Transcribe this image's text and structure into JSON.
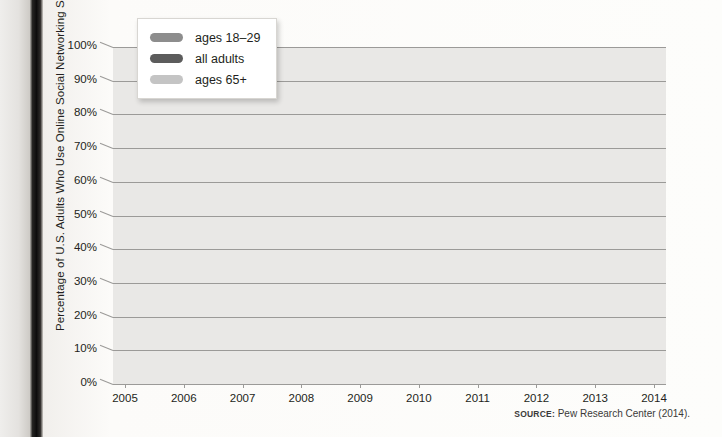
{
  "axis": {
    "y_title": "Percentage of U.S. Adults Who Use Online Social Networking Sites",
    "y_ticks": [
      "100%",
      "90%",
      "80%",
      "70%",
      "60%",
      "50%",
      "40%",
      "30%",
      "20%",
      "10%",
      "0%"
    ],
    "x_ticks": [
      "2005",
      "2006",
      "2007",
      "2008",
      "2009",
      "2010",
      "2011",
      "2012",
      "2013",
      "2014"
    ]
  },
  "legend": {
    "items": [
      {
        "label": "ages 18–29",
        "color": "#8d8d8d"
      },
      {
        "label": "all adults",
        "color": "#5c5c5c"
      },
      {
        "label": "ages 65+",
        "color": "#c4c4c4"
      }
    ]
  },
  "source": {
    "keyword": "SOURCE:",
    "text": " Pew Research Center (2014)."
  },
  "colors": {
    "plot_background": "#e9e8e6",
    "gridline": "#9b9a98",
    "text": "#231f20"
  },
  "chart_data": {
    "type": "line",
    "title": "",
    "xlabel": "",
    "ylabel": "Percentage of U.S. Adults Who Use Online Social Networking Sites",
    "x": [
      2005,
      2006,
      2007,
      2008,
      2009,
      2010,
      2011,
      2012,
      2013,
      2014
    ],
    "xlim": [
      2005,
      2014
    ],
    "ylim": [
      0,
      100
    ],
    "ytick_step": 10,
    "grid": true,
    "legend_position": "top-left",
    "series": [
      {
        "name": "ages 18–29",
        "color": "#8d8d8d",
        "values": [
          21.5,
          40,
          59,
          79,
          77,
          92,
          92,
          90,
          93,
          93
        ]
      },
      {
        "name": "all adults",
        "color": "#5c5c5c",
        "values": [
          16,
          23,
          30,
          37,
          51,
          66,
          69,
          71,
          76,
          78
        ]
      },
      {
        "name": "ages 65+",
        "color": "#c4c4c4",
        "values": [
          10,
          9.5,
          9,
          9,
          18,
          27,
          34,
          40,
          47,
          53
        ]
      }
    ]
  }
}
